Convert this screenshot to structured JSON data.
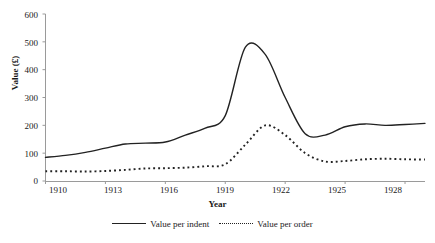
{
  "chart_data": {
    "type": "line",
    "title": "",
    "xlabel": "Year",
    "ylabel": "Value (£)",
    "xlim": [
      1910,
      1929
    ],
    "ylim": [
      0,
      600
    ],
    "y_ticks": [
      0,
      100,
      200,
      300,
      400,
      500,
      600
    ],
    "y_tick_labels": [
      "0",
      "100",
      "200",
      "300",
      "400",
      "500",
      "600"
    ],
    "x_ticks": [
      1910,
      1913,
      1916,
      1919,
      1922,
      1925,
      1928
    ],
    "x_tick_labels": [
      "1910",
      "1913",
      "1916",
      "1919",
      "1922",
      "1925",
      "1928"
    ],
    "grid": false,
    "legend_position": "bottom",
    "x": [
      1910,
      1911,
      1912,
      1913,
      1914,
      1915,
      1916,
      1917,
      1918,
      1919,
      1920,
      1921,
      1922,
      1923,
      1924,
      1925,
      1926,
      1927,
      1928,
      1929
    ],
    "series": [
      {
        "name": "Value per indent",
        "style": "solid",
        "color": "#222222",
        "values": [
          85,
          92,
          103,
          118,
          133,
          136,
          140,
          165,
          190,
          235,
          480,
          455,
          300,
          170,
          165,
          195,
          205,
          200,
          203,
          207
        ]
      },
      {
        "name": "Value per order",
        "style": "dotted",
        "color": "#222222",
        "values": [
          35,
          35,
          34,
          36,
          40,
          45,
          46,
          48,
          53,
          60,
          130,
          200,
          165,
          100,
          70,
          72,
          78,
          80,
          78,
          77
        ]
      }
    ]
  },
  "axes": {
    "y_title": "Value (£)",
    "x_title": "Year",
    "y_labels": [
      "600",
      "500",
      "400",
      "300",
      "200",
      "100",
      "0"
    ],
    "x_labels": [
      "1910",
      "1913",
      "1916",
      "1919",
      "1922",
      "1925",
      "1928"
    ]
  },
  "legend": {
    "items": [
      {
        "label": "Value per indent",
        "style": "solid"
      },
      {
        "label": "Value per order",
        "style": "dotted"
      }
    ]
  },
  "colors": {
    "line": "#222222",
    "axis": "#888888",
    "text": "#1a1a1a",
    "background": "#ffffff"
  }
}
